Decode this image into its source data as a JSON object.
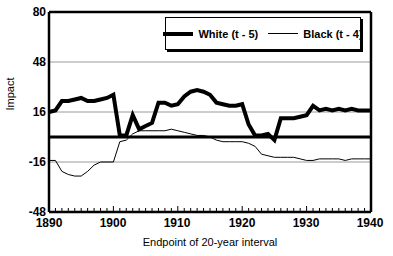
{
  "chart_data": {
    "type": "line",
    "title": "",
    "xlabel": "Endpoint of 20-year interval",
    "ylabel": "Impact",
    "xlim": [
      1890,
      1940
    ],
    "ylim": [
      -48,
      80
    ],
    "xticks": [
      1890,
      1900,
      1910,
      1920,
      1930,
      1940
    ],
    "yticks": [
      -48,
      -16,
      16,
      48,
      80
    ],
    "gridlines": [
      48,
      16,
      -16
    ],
    "zero_line": 0,
    "minor_xtick_step": 1,
    "legend_position": "top-center",
    "series": [
      {
        "name": "White (t - 5)",
        "style": "thick",
        "x": [
          1890,
          1891,
          1892,
          1893,
          1894,
          1895,
          1896,
          1897,
          1898,
          1899,
          1900,
          1901,
          1902,
          1903,
          1904,
          1905,
          1906,
          1907,
          1908,
          1909,
          1910,
          1911,
          1912,
          1913,
          1914,
          1915,
          1916,
          1917,
          1918,
          1919,
          1920,
          1921,
          1922,
          1923,
          1924,
          1925,
          1926,
          1927,
          1928,
          1929,
          1930,
          1931,
          1932,
          1933,
          1934,
          1935,
          1936,
          1937,
          1938,
          1939,
          1940
        ],
        "values": [
          16,
          17,
          23,
          23,
          24,
          25,
          23,
          23,
          24,
          25,
          27,
          1,
          1,
          14,
          5,
          7,
          9,
          22,
          22,
          20,
          21,
          26,
          29,
          30,
          29,
          27,
          22,
          21,
          20,
          20,
          21,
          8,
          1,
          1,
          2,
          -2,
          12,
          12,
          12,
          13,
          14,
          20,
          17,
          18,
          17,
          18,
          17,
          18,
          17,
          17,
          17
        ]
      },
      {
        "name": "Black (t - 4)",
        "style": "thin",
        "x": [
          1890,
          1891,
          1892,
          1893,
          1894,
          1895,
          1896,
          1897,
          1898,
          1899,
          1900,
          1901,
          1902,
          1903,
          1904,
          1905,
          1906,
          1907,
          1908,
          1909,
          1910,
          1911,
          1912,
          1913,
          1914,
          1915,
          1916,
          1917,
          1918,
          1919,
          1920,
          1921,
          1922,
          1923,
          1924,
          1925,
          1926,
          1927,
          1928,
          1929,
          1930,
          1931,
          1932,
          1933,
          1934,
          1935,
          1936,
          1937,
          1938,
          1939,
          1940
        ],
        "values": [
          -15,
          -15,
          -22,
          -24,
          -25,
          -25,
          -22,
          -18,
          -16,
          -16,
          -16,
          -3,
          -2,
          2,
          4,
          4,
          4,
          4,
          4,
          5,
          4,
          3,
          2,
          1,
          1,
          0,
          -2,
          -3,
          -3,
          -3,
          -3,
          -4,
          -6,
          -11,
          -12,
          -13,
          -13,
          -13,
          -13,
          -14,
          -15,
          -15,
          -14,
          -14,
          -14,
          -14,
          -15,
          -14,
          -14,
          -14,
          -14
        ]
      }
    ]
  },
  "axes": {
    "ytick_labels": [
      "80",
      "48",
      "16",
      "-16",
      "-48"
    ],
    "xtick_labels": [
      "1890",
      "1900",
      "1910",
      "1920",
      "1930",
      "1940"
    ]
  },
  "legend": {
    "entries": [
      {
        "label": "White (t - 5)",
        "style": "thick"
      },
      {
        "label": "Black (t - 4)",
        "style": "thin"
      }
    ]
  },
  "colors": {
    "line": "#000000",
    "grid": "#9a9a9a",
    "background": "#ffffff"
  },
  "top_fragment": ""
}
